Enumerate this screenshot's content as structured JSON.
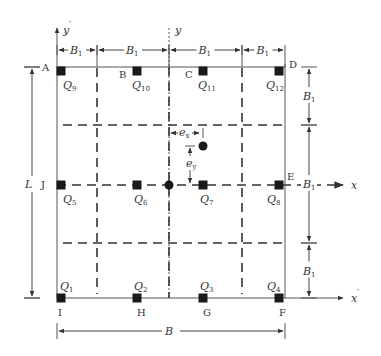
{
  "diagram": {
    "type": "pile-group-plan",
    "boundary": {
      "left": 57,
      "right": 285,
      "top": 67,
      "bottom": 298
    },
    "corner_points": [
      {
        "id": "A",
        "label": "A",
        "x": 42,
        "y": 71
      },
      {
        "id": "B",
        "label": "B",
        "x": 119,
        "y": 78
      },
      {
        "id": "C",
        "label": "C",
        "x": 185,
        "y": 78
      },
      {
        "id": "D",
        "label": "D",
        "x": 289,
        "y": 68
      },
      {
        "id": "E",
        "label": "E",
        "x": 287,
        "y": 180
      },
      {
        "id": "F",
        "label": "F",
        "x": 279,
        "y": 316
      },
      {
        "id": "G",
        "label": "G",
        "x": 203,
        "y": 316
      },
      {
        "id": "H",
        "label": "H",
        "x": 137,
        "y": 316
      },
      {
        "id": "I",
        "label": "I",
        "x": 58,
        "y": 316
      },
      {
        "id": "J",
        "label": "J",
        "x": 41,
        "y": 188
      }
    ],
    "piles": [
      {
        "id": "Q1",
        "base": "Q",
        "sub": "1",
        "x": 61,
        "y": 298,
        "lx": 60,
        "ly": 290
      },
      {
        "id": "Q2",
        "base": "Q",
        "sub": "2",
        "x": 137,
        "y": 298,
        "lx": 134,
        "ly": 290
      },
      {
        "id": "Q3",
        "base": "Q",
        "sub": "3",
        "x": 203,
        "y": 298,
        "lx": 200,
        "ly": 290
      },
      {
        "id": "Q4",
        "base": "Q",
        "sub": "4",
        "x": 279,
        "y": 298,
        "lx": 267,
        "ly": 290
      },
      {
        "id": "Q5",
        "base": "Q",
        "sub": "5",
        "x": 61,
        "y": 185,
        "lx": 63,
        "ly": 203
      },
      {
        "id": "Q6",
        "base": "Q",
        "sub": "6",
        "x": 137,
        "y": 185,
        "lx": 134,
        "ly": 203
      },
      {
        "id": "Q7",
        "base": "Q",
        "sub": "7",
        "x": 203,
        "y": 185,
        "lx": 200,
        "ly": 203
      },
      {
        "id": "Q8",
        "base": "Q",
        "sub": "8",
        "x": 279,
        "y": 185,
        "lx": 267,
        "ly": 203
      },
      {
        "id": "Q9",
        "base": "Q",
        "sub": "9",
        "x": 61,
        "y": 71,
        "lx": 63,
        "ly": 89
      },
      {
        "id": "Q10",
        "base": "Q",
        "sub": "10",
        "x": 137,
        "y": 71,
        "lx": 132,
        "ly": 89
      },
      {
        "id": "Q11",
        "base": "Q",
        "sub": "11",
        "x": 203,
        "y": 71,
        "lx": 198,
        "ly": 89
      },
      {
        "id": "Q12",
        "base": "Q",
        "sub": "12",
        "x": 279,
        "y": 71,
        "lx": 266,
        "ly": 89
      }
    ],
    "centroids": [
      {
        "id": "pile-group-centroid",
        "x": 169,
        "y": 185,
        "r": 4.5
      },
      {
        "id": "load-point",
        "x": 203,
        "y": 146,
        "r": 4.5
      }
    ],
    "grid_dashed_vertical_x": [
      97,
      169,
      242
    ],
    "grid_dashed_horizontal_y": [
      125,
      185,
      243
    ],
    "axes": {
      "y_prime": {
        "label": "y",
        "prime": "′",
        "x": 57,
        "y_top": 24
      },
      "y": {
        "label": "y",
        "x": 169,
        "y_top": 24
      },
      "x": {
        "label": "x",
        "y": 185,
        "x_right": 343
      },
      "x_prime": {
        "label": "x",
        "prime": "′",
        "y": 298,
        "x_right": 343
      }
    },
    "dimensions": {
      "top": [
        {
          "label": "B",
          "sub": "1",
          "x1": 57,
          "x2": 97
        },
        {
          "label": "B",
          "sub": "1",
          "x1": 97,
          "x2": 169
        },
        {
          "label": "B",
          "sub": "1",
          "x1": 169,
          "x2": 242
        },
        {
          "label": "B",
          "sub": "1",
          "x1": 242,
          "x2": 285
        }
      ],
      "right": [
        {
          "label": "B",
          "sub": "1",
          "y1": 67,
          "y2": 125
        },
        {
          "label": "B",
          "sub": "1",
          "y1": 125,
          "y2": 243
        },
        {
          "label": "B",
          "sub": "1",
          "y1": 243,
          "y2": 298
        }
      ],
      "left": {
        "label": "L",
        "y1": 67,
        "y2": 298
      },
      "bottom": {
        "label": "B",
        "x1": 57,
        "x2": 285
      },
      "eccentricity_x": {
        "label": "e",
        "sub": "x"
      },
      "eccentricity_y": {
        "label": "e",
        "sub": "y"
      }
    },
    "colors": {
      "line": "#555555",
      "pile": "#1a1a1a",
      "text": "#333333",
      "background": "#ffffff"
    }
  }
}
